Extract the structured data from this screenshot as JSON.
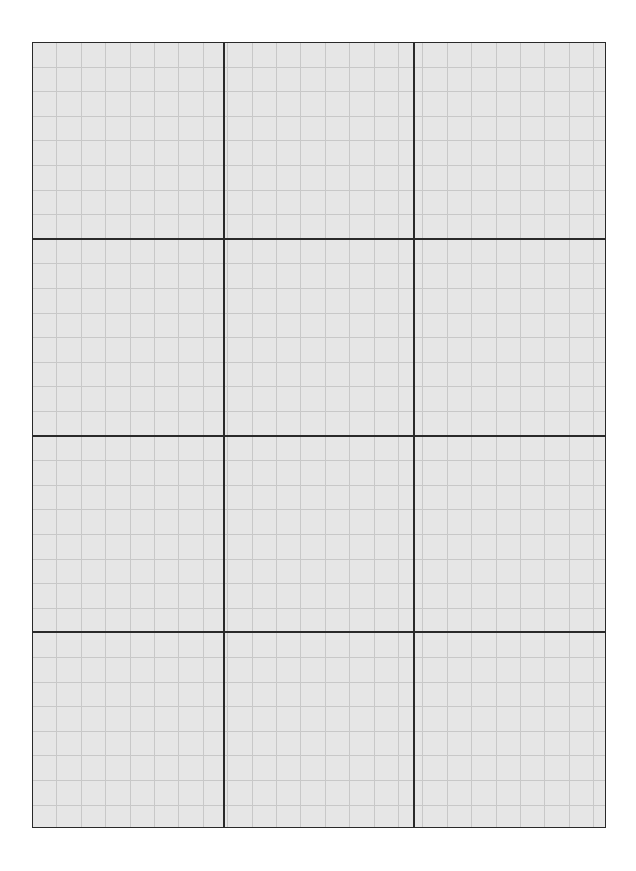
{
  "page": {
    "background": "#ffffff"
  },
  "grid": {
    "fill_color": "#e6e6e6",
    "major_line_color": "#2a2a2a",
    "minor_line_color": "#c8c8c8",
    "major_columns": 3,
    "major_rows": 4,
    "minor_subdivisions_per_major": 8
  }
}
